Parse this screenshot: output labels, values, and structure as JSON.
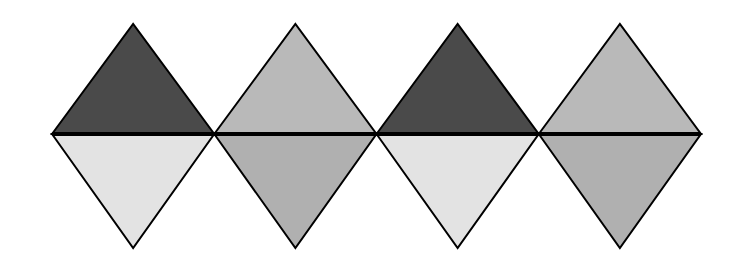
{
  "diagram": {
    "geometry": {
      "left_x": 52,
      "mid_y": 134,
      "top_y": 24,
      "bottom_y": 248,
      "diamond_width": 162.25
    },
    "colors": {
      "dark": "#4a4a4a",
      "medium_top": "#b9b9b9",
      "medium_bottom": "#b0b0b0",
      "light": "#e3e3e3",
      "stroke": "#000000"
    },
    "diamonds": [
      {
        "top": "dark",
        "bottom": "light"
      },
      {
        "top": "medium_top",
        "bottom": "medium_bottom"
      },
      {
        "top": "dark",
        "bottom": "light"
      },
      {
        "top": "medium_top",
        "bottom": "medium_bottom"
      }
    ]
  }
}
